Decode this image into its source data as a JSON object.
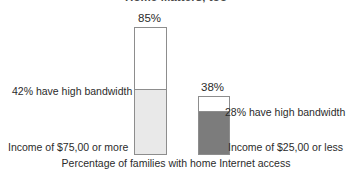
{
  "chart_data": {
    "type": "bar",
    "subtype": "stacked-bar",
    "title": "Home Matters, too",
    "xlabel": "Percentage of families with home Internet access",
    "ylabel": "",
    "ylim": [
      0,
      100
    ],
    "grid": false,
    "legend": "none",
    "categories": [
      "Income of $75,00 or more",
      "Income of $25,00 or less"
    ],
    "totals": [
      85,
      38
    ],
    "total_labels": [
      "85%",
      "38%"
    ],
    "series": [
      {
        "name": "Have high bandwidth",
        "values": [
          42,
          28
        ],
        "color": "#e9e9e9",
        "colors": [
          "#e9e9e9",
          "#7c7c7c"
        ]
      },
      {
        "name": "Remaining home Internet access",
        "values": [
          43,
          10
        ],
        "color": "#ffffff"
      }
    ],
    "annotations": [
      {
        "text": "42% have high bandwidth",
        "category": "Income of $75,00 or more",
        "value": 42,
        "position": "left"
      },
      {
        "text": "28% have high bandwidth",
        "category": "Income of $25,00 or less",
        "value": 28,
        "position": "right"
      }
    ]
  },
  "labels": {
    "title": "Home Matters, too",
    "value_high_income": "85%",
    "value_low_income": "38%",
    "annotation_high_income": "42% have high bandwidth",
    "annotation_low_income": "28% have high bandwidth",
    "category_high_income": "Income of $75,00 or more",
    "category_low_income": "Income of $25,00 or less",
    "caption": "Percentage of families with home Internet access"
  },
  "colors": {
    "background": "#ffffff",
    "bar_outline": "#8d8d8d",
    "segment_empty": "#ffffff",
    "segment_bandwidth_high_income": "#e9e9e9",
    "segment_bandwidth_low_income": "#7c7c7c",
    "text": "#2b2b2b",
    "title_text": "#4a4a4a"
  }
}
